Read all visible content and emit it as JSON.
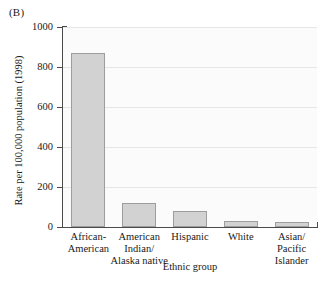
{
  "panel_label": "(B)",
  "chart_data": {
    "type": "bar",
    "title": "",
    "xlabel": "Ethnic group",
    "ylabel": "Rate per 100,000 population (1998)",
    "categories": [
      "African-\nAmerican",
      "American\nIndian/\nAlaska native",
      "Hispanic",
      "White",
      "Asian/\nPacific\nIslander"
    ],
    "category_lines": [
      [
        "African-",
        "American"
      ],
      [
        "American",
        "Indian/",
        "Alaska native"
      ],
      [
        "Hispanic"
      ],
      [
        "White"
      ],
      [
        "Asian/",
        "Pacific",
        "Islander"
      ]
    ],
    "values": [
      870,
      120,
      80,
      30,
      25
    ],
    "ylim": [
      0,
      1000
    ],
    "yticks": [
      0,
      200,
      400,
      600,
      800,
      1000
    ],
    "ytick_labels": [
      "0",
      "200",
      "400",
      "600",
      "800",
      "1000"
    ],
    "grid": true,
    "legend": null,
    "bar_color": "#d2d2d2",
    "bar_edge_color": "#9d9d9d",
    "plot_background": "#fbfbfb",
    "axis_color": "#4a4a4a",
    "gridline_color": "#e6e6e6"
  }
}
